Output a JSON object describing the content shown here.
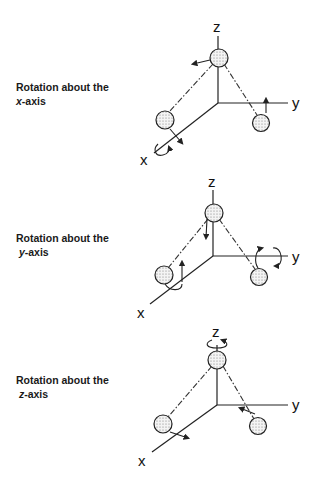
{
  "panels": [
    {
      "label_line1": "Rotation about the",
      "label_axis": "x",
      "label_suffix": "-axis",
      "axis_labels": {
        "z": "z",
        "y": "y",
        "x": "x"
      },
      "rotation_axis": "x"
    },
    {
      "label_line1": "Rotation about the",
      "label_axis": "y",
      "label_suffix": "-axis",
      "axis_labels": {
        "z": "z",
        "y": "y",
        "x": "x"
      },
      "rotation_axis": "y"
    },
    {
      "label_line1": "Rotation about the",
      "label_axis": "z",
      "label_suffix": "-axis",
      "axis_labels": {
        "z": "z",
        "y": "y",
        "x": "x"
      },
      "rotation_axis": "z"
    }
  ]
}
